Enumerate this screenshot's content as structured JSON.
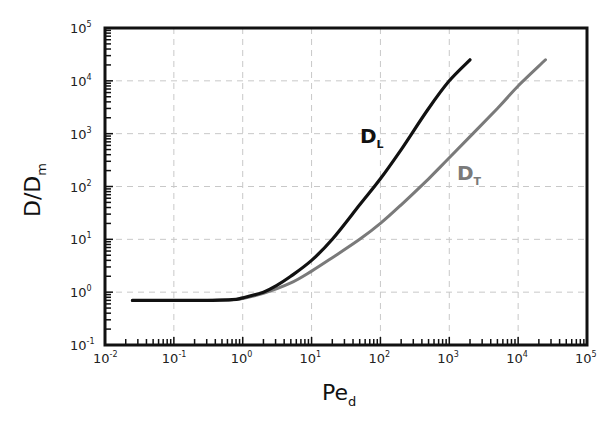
{
  "chart_data": {
    "type": "line",
    "title": "",
    "xlabel": "Pe_d",
    "xlabel_main": "Pe",
    "xlabel_sub": "d",
    "ylabel": "D/D_m",
    "ylabel_main": "D/D",
    "ylabel_sub": "m",
    "xscale": "log",
    "yscale": "log",
    "xlim": [
      0.01,
      100000
    ],
    "ylim": [
      0.1,
      100000
    ],
    "grid": true,
    "legend_position": "inline annotations",
    "x_ticks": [
      {
        "base": "10",
        "exp": "-2"
      },
      {
        "base": "10",
        "exp": "-1"
      },
      {
        "base": "10",
        "exp": "0"
      },
      {
        "base": "10",
        "exp": "1"
      },
      {
        "base": "10",
        "exp": "2"
      },
      {
        "base": "10",
        "exp": "3"
      },
      {
        "base": "10",
        "exp": "4"
      },
      {
        "base": "10",
        "exp": "5"
      }
    ],
    "y_ticks": [
      {
        "base": "10",
        "exp": "-1"
      },
      {
        "base": "10",
        "exp": "0"
      },
      {
        "base": "10",
        "exp": "1"
      },
      {
        "base": "10",
        "exp": "2"
      },
      {
        "base": "10",
        "exp": "3"
      },
      {
        "base": "10",
        "exp": "4"
      },
      {
        "base": "10",
        "exp": "5"
      }
    ],
    "series": [
      {
        "name": "D_L",
        "label_main": "D",
        "label_sub": "L",
        "color": "#111111",
        "x": [
          0.025,
          0.1,
          0.3,
          0.7,
          1,
          2,
          3,
          5,
          10,
          20,
          50,
          100,
          200,
          500,
          1000,
          2000
        ],
        "y": [
          0.7,
          0.7,
          0.7,
          0.72,
          0.78,
          1.0,
          1.3,
          2.0,
          4.0,
          10,
          45,
          140,
          500,
          3000,
          10000,
          25000
        ]
      },
      {
        "name": "D_T",
        "label_main": "D",
        "label_sub": "T",
        "color": "#7a7a7a",
        "x": [
          0.025,
          0.1,
          0.3,
          0.7,
          1,
          2,
          5,
          10,
          20,
          50,
          100,
          200,
          500,
          1000,
          5000,
          10000,
          25000
        ],
        "y": [
          0.7,
          0.7,
          0.7,
          0.72,
          0.76,
          0.95,
          1.5,
          2.5,
          4.5,
          10,
          20,
          45,
          140,
          350,
          3000,
          8000,
          25000
        ]
      }
    ]
  }
}
